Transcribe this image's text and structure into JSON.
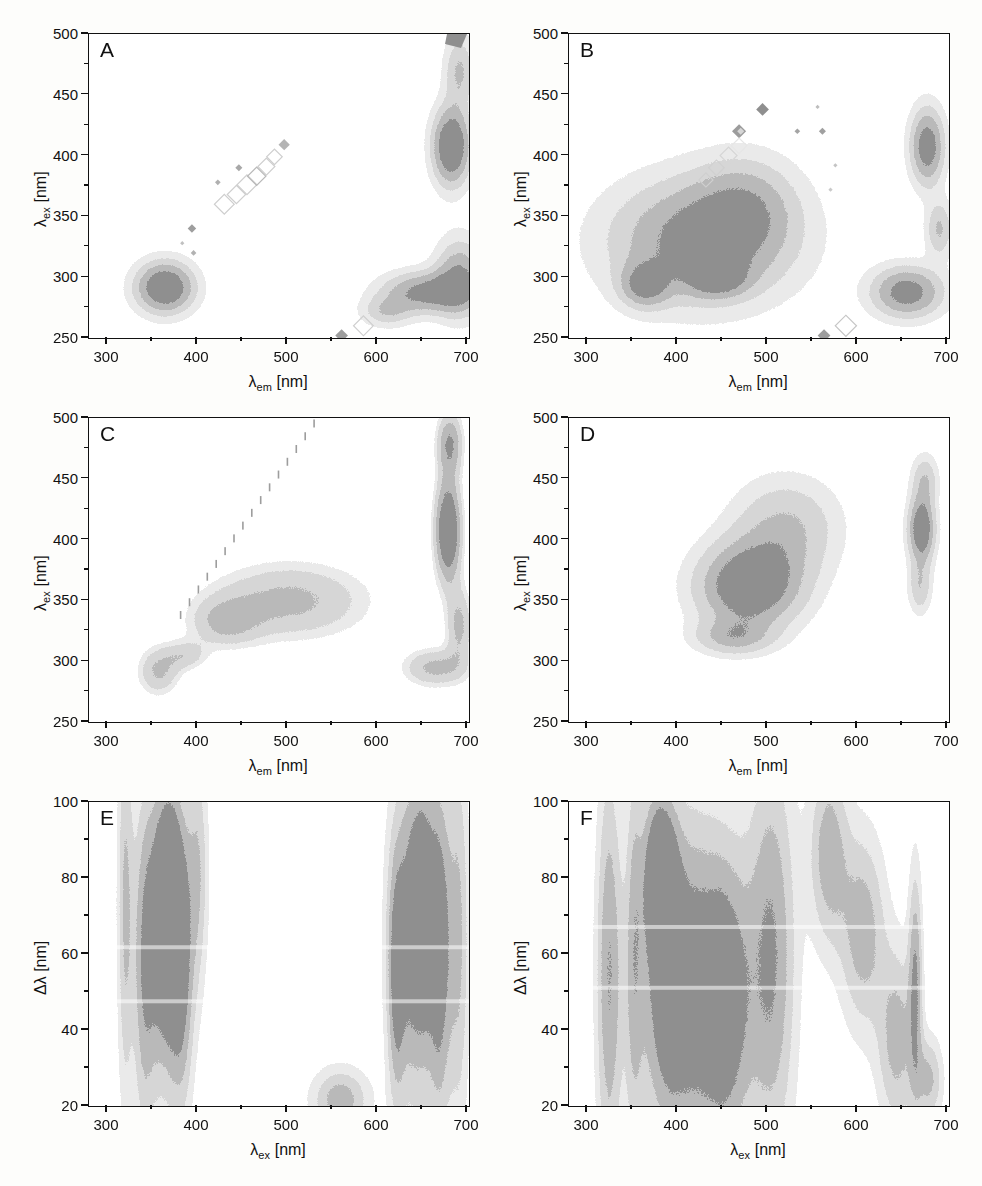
{
  "figure": {
    "panel_count": 6,
    "background": "#fdfdfb",
    "contour_palette": [
      "#8f8f8f",
      "#b9b9b9",
      "#d6d6d6",
      "#eaeaea",
      "#ffffff"
    ]
  },
  "axis_titles": {
    "lambda_em": "λ",
    "lambda_em_sub": "em",
    "lambda_ex": "λ",
    "lambda_ex_sub": "ex",
    "unit": " [nm]",
    "delta_lambda": "Δλ [nm]"
  },
  "panels": [
    {
      "letter": "A",
      "x_ticks": [
        "300",
        "400",
        "500",
        "600",
        "700"
      ],
      "y_ticks": [
        "250",
        "300",
        "350",
        "400",
        "450",
        "500"
      ],
      "xlabel_main": "λ",
      "xlabel_sub": "em",
      "xlabel_unit": " [nm]",
      "ylabel_main": "λ",
      "ylabel_sub": "ex",
      "ylabel_unit": " [nm]"
    },
    {
      "letter": "B",
      "x_ticks": [
        "300",
        "400",
        "500",
        "600",
        "700"
      ],
      "y_ticks": [
        "250",
        "300",
        "350",
        "400",
        "450",
        "500"
      ],
      "xlabel_main": "λ",
      "xlabel_sub": "em",
      "xlabel_unit": " [nm]",
      "ylabel_main": "λ",
      "ylabel_sub": "ex",
      "ylabel_unit": " [nm]"
    },
    {
      "letter": "C",
      "x_ticks": [
        "300",
        "400",
        "500",
        "600",
        "700"
      ],
      "y_ticks": [
        "250",
        "300",
        "350",
        "400",
        "450",
        "500"
      ],
      "xlabel_main": "λ",
      "xlabel_sub": "em",
      "xlabel_unit": " [nm]",
      "ylabel_main": "λ",
      "ylabel_sub": "ex",
      "ylabel_unit": " [nm]"
    },
    {
      "letter": "D",
      "x_ticks": [
        "300",
        "400",
        "500",
        "600",
        "700"
      ],
      "y_ticks": [
        "250",
        "300",
        "350",
        "400",
        "450",
        "500"
      ],
      "xlabel_main": "λ",
      "xlabel_sub": "em",
      "xlabel_unit": " [nm]",
      "ylabel_main": "λ",
      "ylabel_sub": "ex",
      "ylabel_unit": " [nm]"
    },
    {
      "letter": "E",
      "x_ticks": [
        "300",
        "400",
        "500",
        "600",
        "700"
      ],
      "y_ticks": [
        "20",
        "40",
        "60",
        "80",
        "100"
      ],
      "xlabel_main": "λ",
      "xlabel_sub": "ex",
      "xlabel_unit": " [nm]",
      "ylabel_main": "Δλ",
      "ylabel_sub": "",
      "ylabel_unit": " [nm]"
    },
    {
      "letter": "F",
      "x_ticks": [
        "300",
        "400",
        "500",
        "600",
        "700"
      ],
      "y_ticks": [
        "20",
        "40",
        "60",
        "80",
        "100"
      ],
      "xlabel_main": "λ",
      "xlabel_sub": "ex",
      "xlabel_unit": " [nm]",
      "ylabel_main": "Δλ",
      "ylabel_sub": "",
      "ylabel_unit": " [nm]"
    }
  ],
  "chart_data": {
    "type": "heatmap",
    "title": "",
    "subplots": [
      {
        "label": "A",
        "xlabel": "λ_em [nm]",
        "ylabel": "λ_ex [nm]",
        "xlim": [
          255,
          700
        ],
        "ylim": [
          250,
          500
        ],
        "xticks": [
          300,
          400,
          500,
          600,
          700
        ],
        "yticks": [
          250,
          300,
          350,
          400,
          450,
          500
        ],
        "grid": false,
        "legend": "none",
        "features": [
          {
            "name": "protein-like peak",
            "center_em": 325,
            "center_ex": 292,
            "intensity": "high"
          },
          {
            "name": "rayleigh-scatter-diagonal",
            "from_em": 395,
            "from_ex": 358,
            "to_em": 472,
            "to_ex": 410,
            "intensity": "low"
          },
          {
            "name": "second-order-scatter-band",
            "center_em": 680,
            "center_ex": 408,
            "intensity": "high"
          },
          {
            "name": "lower-right-band",
            "center_em": 645,
            "center_ex": 288,
            "intensity": "medium"
          }
        ]
      },
      {
        "label": "B",
        "xlabel": "λ_em [nm]",
        "ylabel": "λ_ex [nm]",
        "xlim": [
          255,
          700
        ],
        "ylim": [
          250,
          500
        ],
        "xticks": [
          300,
          400,
          500,
          600,
          700
        ],
        "yticks": [
          250,
          300,
          350,
          400,
          450,
          500
        ],
        "grid": false,
        "legend": "none",
        "features": [
          {
            "name": "broad-humic-region",
            "center_em": 400,
            "center_ex": 320,
            "intensity": "high"
          },
          {
            "name": "peak-1",
            "center_em": 325,
            "center_ex": 295,
            "intensity": "high"
          },
          {
            "name": "peak-2",
            "center_em": 415,
            "center_ex": 300,
            "intensity": "high"
          },
          {
            "name": "second-order-scatter-band",
            "center_em": 675,
            "center_ex": 408,
            "intensity": "medium"
          },
          {
            "name": "lower-right-band",
            "center_em": 650,
            "center_ex": 288,
            "intensity": "medium"
          }
        ]
      },
      {
        "label": "C",
        "xlabel": "λ_em [nm]",
        "ylabel": "λ_ex [nm]",
        "xlim": [
          255,
          700
        ],
        "ylim": [
          250,
          500
        ],
        "xticks": [
          300,
          400,
          500,
          600,
          700
        ],
        "yticks": [
          250,
          300,
          350,
          400,
          450,
          500
        ],
        "grid": false,
        "legend": "none",
        "features": [
          {
            "name": "broad-plateau",
            "center_em": 480,
            "center_ex": 350,
            "intensity": "medium"
          },
          {
            "name": "lower-left-lobe",
            "center_em": 315,
            "center_ex": 290,
            "intensity": "medium"
          },
          {
            "name": "rayleigh-diagonal-streak",
            "from_em": 345,
            "from_ex": 340,
            "to_em": 510,
            "to_ex": 500,
            "intensity": "low"
          },
          {
            "name": "right-scatter-ellipse",
            "center_em": 675,
            "center_ex": 408,
            "intensity": "high"
          }
        ]
      },
      {
        "label": "D",
        "xlabel": "λ_em [nm]",
        "ylabel": "λ_ex [nm]",
        "xlim": [
          255,
          700
        ],
        "ylim": [
          250,
          500
        ],
        "xticks": [
          300,
          400,
          500,
          600,
          700
        ],
        "yticks": [
          250,
          300,
          350,
          400,
          450,
          500
        ],
        "grid": false,
        "legend": "none",
        "features": [
          {
            "name": "main-fluorophore-peak",
            "center_em": 455,
            "center_ex": 362,
            "intensity": "high"
          },
          {
            "name": "shoulder-peak",
            "center_em": 435,
            "center_ex": 320,
            "intensity": "medium"
          },
          {
            "name": "right-scatter-peak",
            "center_em": 668,
            "center_ex": 409,
            "intensity": "high"
          }
        ]
      },
      {
        "label": "E",
        "xlabel": "λ_ex [nm]",
        "ylabel": "Δλ [nm]",
        "xlim": [
          275,
          700
        ],
        "ylim": [
          10,
          100
        ],
        "xticks": [
          300,
          400,
          500,
          600,
          700
        ],
        "yticks": [
          20,
          40,
          60,
          80,
          100
        ],
        "grid": false,
        "legend": "none",
        "features": [
          {
            "name": "left-band",
            "center_ex": 340,
            "center_dl": 60,
            "intensity": "high"
          },
          {
            "name": "right-band",
            "center_ex": 640,
            "center_dl": 60,
            "intensity": "high"
          },
          {
            "name": "low-delta-lobe",
            "center_ex": 550,
            "center_dl": 14,
            "intensity": "medium"
          }
        ]
      },
      {
        "label": "F",
        "xlabel": "λ_ex [nm]",
        "ylabel": "Δλ [nm]",
        "xlim": [
          275,
          700
        ],
        "ylim": [
          10,
          100
        ],
        "xticks": [
          300,
          400,
          500,
          600,
          700
        ],
        "yticks": [
          20,
          40,
          60,
          80,
          100
        ],
        "grid": false,
        "legend": "none",
        "features": [
          {
            "name": "broad-left-band",
            "center_ex": 390,
            "center_dl": 45,
            "intensity": "high"
          },
          {
            "name": "dark-core",
            "center_ex": 360,
            "center_dl": 80,
            "intensity": "high"
          },
          {
            "name": "diagonal-scatter-band",
            "center_ex": 590,
            "center_dl": 60,
            "intensity": "medium"
          },
          {
            "name": "right-spike",
            "center_ex": 662,
            "center_dl": 50,
            "intensity": "medium"
          }
        ]
      }
    ]
  }
}
